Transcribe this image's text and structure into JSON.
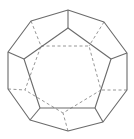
{
  "figure": {
    "colors": {
      "background": "#ffffff",
      "solid_edge": "#6b6b6b",
      "hidden_edge": "#8a8a8a"
    }
  },
  "geometry": {
    "outer_decagon": [
      [
        68,
        10
      ],
      [
        104,
        22
      ],
      [
        127,
        53
      ],
      [
        127,
        90
      ],
      [
        103,
        122
      ],
      [
        68,
        131
      ],
      [
        30,
        120
      ],
      [
        8,
        89
      ],
      [
        8,
        52
      ],
      [
        31,
        21
      ]
    ],
    "front_pentagon": [
      [
        68,
        28
      ],
      [
        111,
        59
      ],
      [
        95,
        108
      ],
      [
        40,
        108
      ],
      [
        24,
        59
      ]
    ],
    "front_spokes": [
      [
        [
          68,
          10
        ],
        [
          68,
          28
        ]
      ],
      [
        [
          127,
          53
        ],
        [
          111,
          59
        ]
      ],
      [
        [
          103,
          122
        ],
        [
          95,
          108
        ]
      ],
      [
        [
          30,
          120
        ],
        [
          40,
          108
        ]
      ],
      [
        [
          8,
          52
        ],
        [
          24,
          59
        ]
      ]
    ],
    "back_pentagon": [
      [
        41,
        46
      ],
      [
        89,
        46
      ],
      [
        101,
        90
      ],
      [
        63,
        113
      ],
      [
        25,
        90
      ]
    ],
    "back_spokes": [
      [
        [
          31,
          21
        ],
        [
          41,
          46
        ]
      ],
      [
        [
          104,
          22
        ],
        [
          89,
          46
        ]
      ],
      [
        [
          127,
          90
        ],
        [
          101,
          90
        ]
      ],
      [
        [
          68,
          131
        ],
        [
          63,
          113
        ]
      ],
      [
        [
          8,
          89
        ],
        [
          25,
          90
        ]
      ]
    ]
  }
}
